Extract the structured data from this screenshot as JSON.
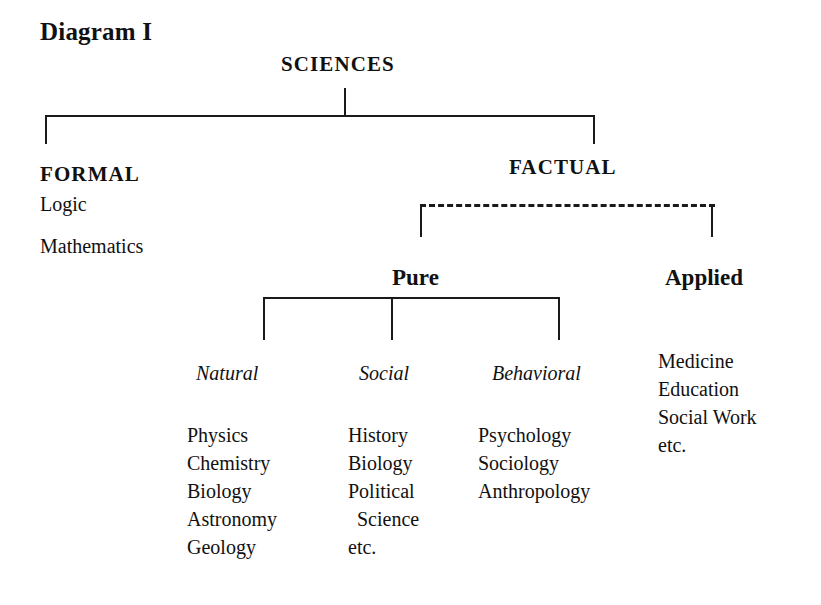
{
  "figure": {
    "title": "Diagram I"
  },
  "tree": {
    "root": {
      "label": "SCIENCES"
    },
    "formal": {
      "label": "FORMAL",
      "items": [
        "Logic",
        "Mathematics"
      ]
    },
    "factual": {
      "label": "FACTUAL",
      "pure": {
        "label": "Pure",
        "columns": [
          {
            "label": "Natural",
            "items": [
              "Physics",
              "Chemistry",
              "Biology",
              "Astronomy",
              "Geology"
            ]
          },
          {
            "label": "Social",
            "items": [
              "History",
              "Biology",
              "Political",
              "Science",
              "etc."
            ]
          },
          {
            "label": "Behavioral",
            "items": [
              "Psychology",
              "Sociology",
              "Anthropology"
            ]
          }
        ]
      },
      "applied": {
        "label": "Applied",
        "items": [
          "Medicine",
          "Education",
          "Social Work",
          "etc."
        ]
      }
    }
  },
  "style": {
    "ink": "#1a1a1a",
    "paper": "#ffffff"
  }
}
